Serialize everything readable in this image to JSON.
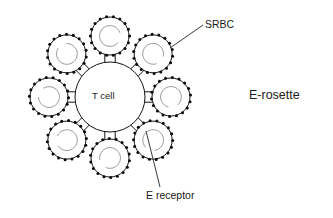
{
  "figure": {
    "kind": "biology-schematic",
    "title_label": "E-rosette",
    "background_color": "#ffffff",
    "ink_color": "#141414",
    "width": 333,
    "height": 218
  },
  "labels": {
    "srbc": "SRBC",
    "e_receptor": "E receptor",
    "e_rosette": "E-rosette",
    "t_cell": "T cell"
  },
  "chart_data": {
    "type": "diagram",
    "title": "E-rosette",
    "center_cell": {
      "label": "T cell",
      "cx": 110,
      "cy": 97,
      "r": 35
    },
    "srbc_count": 8,
    "srbc_radius": 19,
    "srbc_spike_count": 18,
    "srbc_orbit_radius": 61,
    "srbc_angles_deg": [
      270,
      315,
      0,
      45,
      90,
      135,
      180,
      225
    ],
    "receptor_count": 8,
    "receptor_angles_deg": [
      270,
      315,
      0,
      45,
      90,
      135,
      180,
      225
    ],
    "annotations": [
      {
        "text": "SRBC",
        "leader_from": [
          170,
          48
        ],
        "leader_to": [
          203,
          25
        ],
        "text_at": [
          205,
          19
        ]
      },
      {
        "text": "E receptor",
        "leader_from": [
          146,
          131
        ],
        "leader_to": [
          160,
          187
        ],
        "text_at": [
          146,
          190
        ]
      },
      {
        "text": "E-rosette",
        "leader_from": null,
        "leader_to": null,
        "text_at": [
          249,
          89
        ]
      }
    ],
    "colors": {
      "outline": "#141414",
      "spike": "#0a0a0a",
      "inner_arc": "#9a9a9a",
      "leader": "#3a3a3a",
      "text": "#1b1b1b",
      "background": "#ffffff"
    }
  }
}
